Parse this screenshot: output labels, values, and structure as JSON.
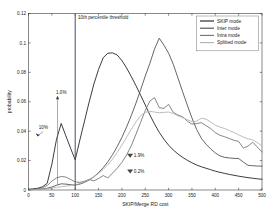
{
  "chart_data": {
    "type": "line",
    "title": "",
    "xlabel": "SKIP/Merge RD cost",
    "ylabel": "probability",
    "xlim": [
      0,
      500
    ],
    "ylim": [
      0,
      0.12
    ],
    "grid": false,
    "legend_position": "top-right",
    "xticks": [
      0,
      50,
      100,
      150,
      200,
      250,
      300,
      350,
      400,
      450,
      500
    ],
    "xtick_labels": [
      "0",
      "50",
      "100",
      "150",
      "200",
      "250",
      "300",
      "350",
      "400",
      "450",
      "500"
    ],
    "yticks": [
      0,
      0.02,
      0.04,
      0.06,
      0.08,
      0.1,
      0.12
    ],
    "ytick_labels": [
      "0",
      "0.02",
      "0.04",
      "0.06",
      "0.08",
      "0.1",
      "0.12"
    ],
    "x": [
      0,
      10,
      20,
      30,
      40,
      50,
      60,
      70,
      80,
      90,
      100,
      110,
      120,
      130,
      140,
      150,
      160,
      170,
      180,
      190,
      200,
      210,
      220,
      230,
      240,
      250,
      260,
      270,
      280,
      290,
      300,
      310,
      320,
      330,
      340,
      350,
      360,
      370,
      380,
      390,
      400,
      410,
      420,
      430,
      440,
      450,
      460,
      470,
      480,
      490,
      500
    ],
    "series": [
      {
        "name": "SKIP mode",
        "color": "#1a1a1a",
        "values": [
          0.0005,
          0.0008,
          0.0012,
          0.0022,
          0.0045,
          0.0175,
          0.0345,
          0.0452,
          0.0368,
          0.0285,
          0.0205,
          0.034,
          0.047,
          0.06,
          0.072,
          0.082,
          0.09,
          0.093,
          0.0932,
          0.0918,
          0.088,
          0.083,
          0.0772,
          0.071,
          0.0645,
          0.0578,
          0.051,
          0.0448,
          0.0392,
          0.0345,
          0.0305,
          0.0272,
          0.0245,
          0.0222,
          0.0202,
          0.0185,
          0.017,
          0.0158,
          0.0148,
          0.0138,
          0.0128,
          0.012,
          0.0113,
          0.0106,
          0.01,
          0.0094,
          0.0089,
          0.0084,
          0.008,
          0.0076,
          0.0073
        ]
      },
      {
        "name": "Inter mode",
        "color": "#4a4a4a",
        "values": [
          0.0002,
          0.0003,
          0.0005,
          0.0008,
          0.0012,
          0.002,
          0.0032,
          0.0042,
          0.004,
          0.0036,
          0.0033,
          0.004,
          0.0052,
          0.0068,
          0.009,
          0.0118,
          0.0152,
          0.0192,
          0.024,
          0.0295,
          0.0358,
          0.0428,
          0.0505,
          0.059,
          0.068,
          0.0775,
          0.0862,
          0.096,
          0.1032,
          0.0985,
          0.093,
          0.0855,
          0.0762,
          0.0668,
          0.0578,
          0.049,
          0.0412,
          0.0352,
          0.0312,
          0.028,
          0.0252,
          0.0232,
          0.0222,
          0.0218,
          0.0215,
          0.0214,
          0.019,
          0.0168,
          0.0165,
          0.0163,
          0.0162
        ]
      },
      {
        "name": "Intra mode",
        "color": "#707070",
        "values": [
          0.0002,
          0.0004,
          0.0008,
          0.0016,
          0.003,
          0.006,
          0.0082,
          0.0092,
          0.0088,
          0.0072,
          0.0055,
          0.0052,
          0.006,
          0.0072,
          0.0062,
          0.0078,
          0.0098,
          0.0082,
          0.0115,
          0.0148,
          0.0188,
          0.0238,
          0.03,
          0.0378,
          0.046,
          0.054,
          0.0605,
          0.0628,
          0.056,
          0.0555,
          0.0582,
          0.0528,
          0.051,
          0.0498,
          0.0468,
          0.0448,
          0.0452,
          0.0458,
          0.0438,
          0.0418,
          0.039,
          0.0372,
          0.0362,
          0.035,
          0.0338,
          0.033,
          0.0285,
          0.0298,
          0.0325,
          0.0292,
          0.0258
        ]
      },
      {
        "name": "Splitted mode",
        "color": "#b0b0b0",
        "values": [
          0.0001,
          0.0002,
          0.0003,
          0.0005,
          0.0008,
          0.0012,
          0.0018,
          0.0022,
          0.0026,
          0.003,
          0.0035,
          0.0045,
          0.0058,
          0.0072,
          0.009,
          0.0112,
          0.014,
          0.0172,
          0.021,
          0.0255,
          0.0305,
          0.0358,
          0.0412,
          0.0462,
          0.0505,
          0.0528,
          0.0535,
          0.053,
          0.0525,
          0.0528,
          0.053,
          0.052,
          0.0505,
          0.0492,
          0.0478,
          0.0465,
          0.0468,
          0.0488,
          0.0482,
          0.0462,
          0.044,
          0.0428,
          0.0418,
          0.0405,
          0.039,
          0.0375,
          0.036,
          0.0348,
          0.034,
          0.0322,
          0.03
        ]
      }
    ],
    "annotations": [
      {
        "text": "10th percentile threshold",
        "x": 106,
        "y": 0.1165,
        "kind": "threshold-label"
      },
      {
        "text": "10%",
        "x": 22,
        "y": 0.0415,
        "kind": "arrow-down-right"
      },
      {
        "text": "1.0%",
        "x": 60,
        "y": 0.0655,
        "kind": "arrow-up"
      },
      {
        "text": "1.9%",
        "x": 218,
        "y": 0.0235,
        "kind": "arrow-down"
      },
      {
        "text": "0.2%",
        "x": 218,
        "y": 0.0128,
        "kind": "arrow-down"
      }
    ],
    "threshold": {
      "x": 100,
      "label": "10th percentile threshold",
      "color": "#4a4a6a"
    }
  }
}
